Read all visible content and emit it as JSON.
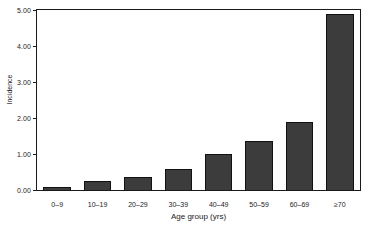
{
  "chart_data": {
    "type": "bar",
    "title": "",
    "subtitle": "",
    "xlabel": "Age group (yrs)",
    "ylabel": "Incidence",
    "categories": [
      "0–9",
      "10–19",
      "20–29",
      "30–39",
      "40–49",
      "50–59",
      "60–69",
      "≥70"
    ],
    "values": [
      0.07,
      0.24,
      0.35,
      0.59,
      1.0,
      1.37,
      1.9,
      4.9
    ],
    "ylim": [
      0,
      5
    ],
    "ytick_labels": [
      "0.00",
      "1.00",
      "2.00",
      "3.00",
      "4.00",
      "5.00"
    ],
    "ytick_values": [
      0,
      1,
      2,
      3,
      4,
      5
    ],
    "grid": false,
    "legend": "none",
    "bar_color": "#3c3c3c",
    "bar_edge_color": "#111111",
    "axis_color": "#1a1a1a",
    "background_color": "#ffffff"
  }
}
